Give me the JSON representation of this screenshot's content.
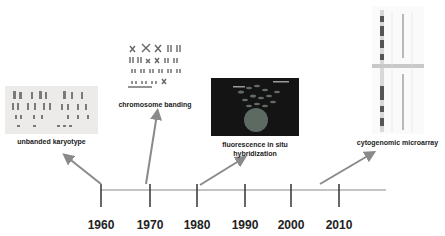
{
  "diagram": {
    "type": "timeline",
    "timeline": {
      "years": [
        "1960",
        "1970",
        "1980",
        "1990",
        "2000",
        "2010"
      ]
    },
    "milestones": [
      {
        "label": "unbanded karyotype",
        "image": "unbanded-karyotype-image",
        "era": "1960"
      },
      {
        "label": "chromosome banding",
        "image": "chromosome-banding-image",
        "era": "1970"
      },
      {
        "label_line1": "fluorescence in situ",
        "label_line2": "hybridization",
        "image": "fish-image",
        "era": "1980"
      },
      {
        "label": "cytogenomic microarray",
        "image": "microarray-image",
        "era": "2005"
      }
    ],
    "colors": {
      "axis": "#7a7a7a",
      "tick": "#333333",
      "arrow": "#8a8a8a",
      "text": "#222222",
      "fish_background": "#141414"
    }
  }
}
